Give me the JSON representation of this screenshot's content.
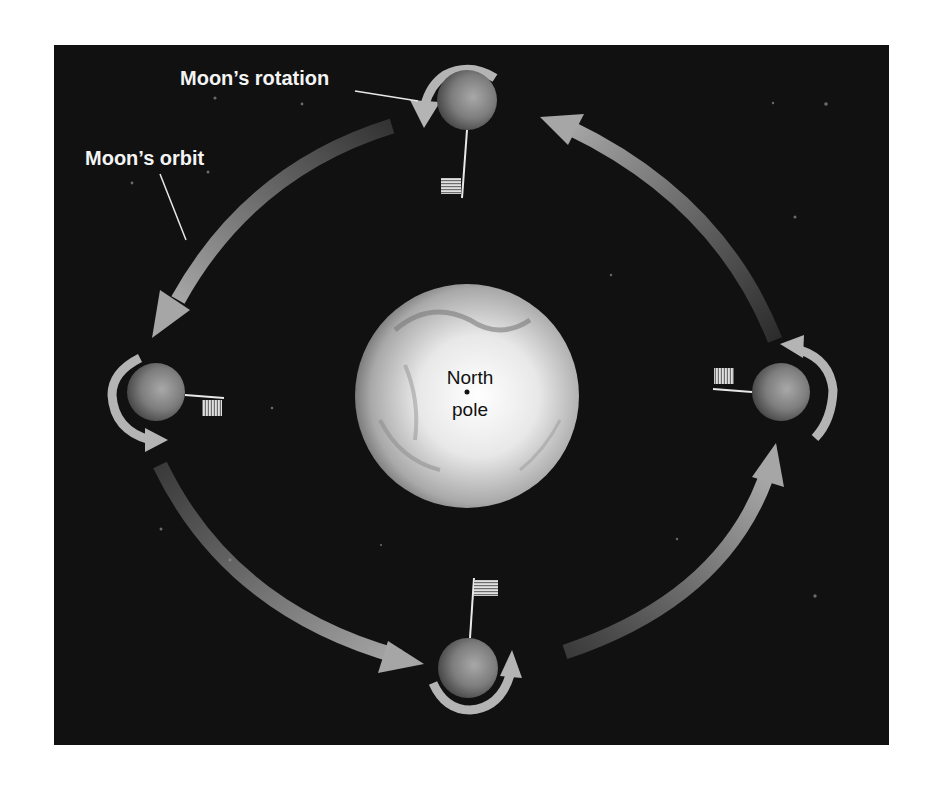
{
  "diagram": {
    "labels": {
      "rotation": "Moon’s rotation",
      "orbit": "Moon’s orbit",
      "earth_line1": "North",
      "earth_line2": "pole"
    },
    "colors": {
      "background": "#ffffff",
      "space": "#111111",
      "arrow": "#9a9a9a",
      "label": "#f4f4f4",
      "earth_label": "#111111"
    },
    "nodes": [
      {
        "id": "earth",
        "name": "Earth (viewed from North pole)",
        "cx": 467,
        "cy": 396,
        "r": 112
      },
      {
        "id": "moon-top",
        "name": "Moon",
        "cx": 467,
        "cy": 100,
        "r": 30,
        "flag": "below"
      },
      {
        "id": "moon-left",
        "name": "Moon",
        "cx": 156,
        "cy": 392,
        "r": 29,
        "flag": "right"
      },
      {
        "id": "moon-right",
        "name": "Moon",
        "cx": 781,
        "cy": 392,
        "r": 29,
        "flag": "left"
      },
      {
        "id": "moon-bottom",
        "name": "Moon",
        "cx": 468,
        "cy": 668,
        "r": 30,
        "flag": "above"
      }
    ],
    "edges": [
      {
        "from": "moon-top",
        "to": "moon-left",
        "type": "orbit-arrow",
        "direction": "counterclockwise"
      },
      {
        "from": "moon-left",
        "to": "moon-bottom",
        "type": "orbit-arrow",
        "direction": "counterclockwise"
      },
      {
        "from": "moon-bottom",
        "to": "moon-right",
        "type": "orbit-arrow",
        "direction": "counterclockwise"
      },
      {
        "from": "moon-right",
        "to": "moon-top",
        "type": "orbit-arrow",
        "direction": "counterclockwise"
      }
    ]
  }
}
